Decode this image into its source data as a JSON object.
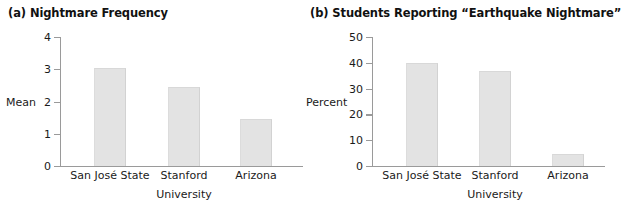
{
  "chart_data": [
    {
      "id": "a",
      "type": "bar",
      "title": "(a) Nightmare Frequency",
      "categories": [
        "San José State",
        "Stanford",
        "Arizona"
      ],
      "values": [
        3.05,
        2.45,
        1.45
      ],
      "xlabel": "University",
      "ylabel": "Mean",
      "ylim": [
        0,
        4
      ],
      "yticks": [
        0,
        1,
        2,
        3,
        4
      ],
      "ytick_labels": [
        "0",
        "1",
        "2",
        "3",
        "4"
      ],
      "grid": false,
      "legend": null,
      "bar_color": "#e3e3e3",
      "axis_color": "#9a9a9a",
      "ylabel_value": 2
    },
    {
      "id": "b",
      "type": "bar",
      "title": "(b) Students Reporting “Earthquake Nightmare”",
      "categories": [
        "San José State",
        "Stanford",
        "Arizona"
      ],
      "values": [
        40,
        37,
        4.5
      ],
      "xlabel": "University",
      "ylabel": "Percent",
      "ylim": [
        0,
        50
      ],
      "yticks": [
        0,
        10,
        20,
        30,
        40,
        50
      ],
      "ytick_labels": [
        "0",
        "10",
        "20",
        "30",
        "40",
        "50"
      ],
      "grid": false,
      "legend": null,
      "bar_color": "#e3e3e3",
      "axis_color": "#9a9a9a",
      "ylabel_value": 25
    }
  ]
}
